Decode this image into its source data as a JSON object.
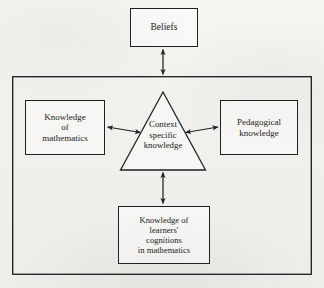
{
  "diagram": {
    "background_color": "#f2f1ee",
    "line_color": "#23211f",
    "outer_frame": {
      "name": "outer-frame",
      "x": 12,
      "y": 76,
      "width": 300,
      "height": 199
    },
    "nodes": {
      "beliefs": {
        "label": "Beliefs",
        "shape": "rectangle",
        "x": 130,
        "y": 8,
        "width": 68,
        "height": 39
      },
      "knowledge_of_mathematics": {
        "label": "Knowledge\nof\nmathematics",
        "shape": "rectangle",
        "x": 25,
        "y": 100,
        "width": 80,
        "height": 55
      },
      "pedagogical_knowledge": {
        "label": "Pedagogical\nknowledge",
        "shape": "rectangle",
        "x": 220,
        "y": 100,
        "width": 78,
        "height": 55
      },
      "knowledge_of_learners_cognitions": {
        "label": "Knowledge of\nlearners'\ncognitions\nin mathematics",
        "shape": "rectangle",
        "x": 118,
        "y": 206,
        "width": 92,
        "height": 58
      },
      "context_specific_knowledge": {
        "label": "Context\nspecific\nknowledge",
        "shape": "triangle",
        "apex_x": 163,
        "apex_y": 92,
        "base_left_x": 120,
        "base_right_x": 205,
        "base_y": 170
      }
    },
    "connectors": [
      {
        "name": "beliefs-to-frame",
        "from": "beliefs",
        "to": "outer-frame",
        "style": "double-headed-arrow",
        "orientation": "vertical"
      },
      {
        "name": "mathematics-to-context",
        "from": "knowledge_of_mathematics",
        "to": "context_specific_knowledge",
        "style": "double-headed-arrow",
        "orientation": "horizontal"
      },
      {
        "name": "pedagogical-to-context",
        "from": "pedagogical_knowledge",
        "to": "context_specific_knowledge",
        "style": "double-headed-arrow",
        "orientation": "horizontal"
      },
      {
        "name": "learners-cognitions-to-context",
        "from": "knowledge_of_learners_cognitions",
        "to": "context_specific_knowledge",
        "style": "double-headed-arrow",
        "orientation": "vertical"
      }
    ],
    "caption_sliver": ""
  }
}
